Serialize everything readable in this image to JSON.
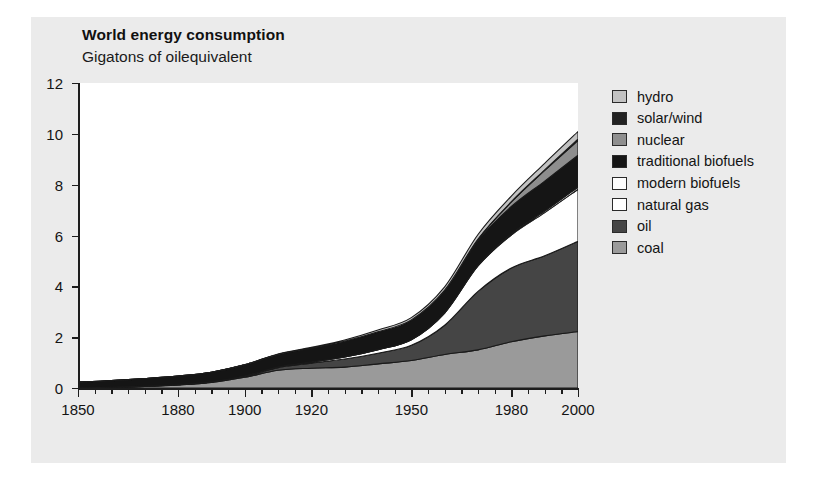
{
  "figure": {
    "background": "#ebebeb",
    "plot_background": "#ffffff",
    "page_background": "#ffffff"
  },
  "chart_data": {
    "type": "area",
    "stacked": true,
    "title": "World energy consumption",
    "subtitle": "Gigatons of oilequivalent",
    "xlabel": "",
    "ylabel": "Gigatons of oilequivalent",
    "xlim": [
      1850,
      2000
    ],
    "ylim": [
      0,
      12
    ],
    "grid": false,
    "legend_position": "right",
    "xticks": [
      1850,
      1860,
      1870,
      1880,
      1890,
      1900,
      1910,
      1920,
      1930,
      1940,
      1950,
      1960,
      1970,
      1980,
      1990,
      2000
    ],
    "xtick_labels": [
      "1850",
      "",
      "",
      "1880",
      "",
      "1900",
      "",
      "1920",
      "",
      "",
      "1950",
      "",
      "",
      "1980",
      "",
      "2000"
    ],
    "yticks": [
      0,
      2,
      4,
      6,
      8,
      10,
      12
    ],
    "ytick_labels": [
      "0",
      "2",
      "4",
      "6",
      "8",
      "10",
      "12"
    ],
    "x": [
      1850,
      1860,
      1870,
      1880,
      1890,
      1900,
      1910,
      1920,
      1930,
      1940,
      1950,
      1960,
      1970,
      1980,
      1990,
      2000
    ],
    "series": [
      {
        "name": "coal",
        "color": "#9a9a9a",
        "values": [
          0.01,
          0.03,
          0.06,
          0.12,
          0.22,
          0.42,
          0.7,
          0.78,
          0.82,
          0.95,
          1.08,
          1.32,
          1.5,
          1.82,
          2.05,
          2.22
        ]
      },
      {
        "name": "oil",
        "color": "#454545",
        "values": [
          0.0,
          0.0,
          0.01,
          0.01,
          0.02,
          0.04,
          0.1,
          0.2,
          0.32,
          0.42,
          0.6,
          1.15,
          2.3,
          2.9,
          3.15,
          3.55
        ]
      },
      {
        "name": "natural gas",
        "color": "#ffffff",
        "values": [
          0.0,
          0.0,
          0.0,
          0.0,
          0.0,
          0.01,
          0.02,
          0.04,
          0.08,
          0.14,
          0.22,
          0.48,
          1.0,
          1.3,
          1.7,
          2.05
        ]
      },
      {
        "name": "modern biofuels",
        "color": "#fdfdfd",
        "values": [
          0.0,
          0.0,
          0.0,
          0.0,
          0.0,
          0.0,
          0.0,
          0.0,
          0.0,
          0.0,
          0.0,
          0.01,
          0.02,
          0.04,
          0.06,
          0.09
        ]
      },
      {
        "name": "traditional biofuels",
        "color": "#151515",
        "values": [
          0.22,
          0.26,
          0.3,
          0.34,
          0.38,
          0.44,
          0.5,
          0.55,
          0.62,
          0.7,
          0.78,
          0.88,
          0.98,
          1.08,
          1.18,
          1.25
        ]
      },
      {
        "name": "nuclear",
        "color": "#8e8e8e",
        "values": [
          0.0,
          0.0,
          0.0,
          0.0,
          0.0,
          0.0,
          0.0,
          0.0,
          0.0,
          0.0,
          0.0,
          0.01,
          0.06,
          0.18,
          0.42,
          0.58
        ]
      },
      {
        "name": "solar/wind",
        "color": "#222222",
        "values": [
          0.0,
          0.0,
          0.0,
          0.0,
          0.0,
          0.0,
          0.0,
          0.0,
          0.0,
          0.0,
          0.0,
          0.0,
          0.0,
          0.01,
          0.02,
          0.05
        ]
      },
      {
        "name": "hydro",
        "color": "#c2c2c2",
        "values": [
          0.0,
          0.0,
          0.0,
          0.0,
          0.0,
          0.01,
          0.02,
          0.03,
          0.05,
          0.07,
          0.09,
          0.13,
          0.18,
          0.22,
          0.26,
          0.3
        ]
      }
    ],
    "totals_note": "stack totals reach about 10.1 Gt oil-equivalent in 2000"
  },
  "legend": {
    "items": [
      {
        "label": "hydro",
        "color": "#c2c2c2"
      },
      {
        "label": "solar/wind",
        "color": "#222222"
      },
      {
        "label": "nuclear",
        "color": "#8e8e8e"
      },
      {
        "label": "traditional biofuels",
        "color": "#151515"
      },
      {
        "label": "modern biofuels",
        "color": "#fdfdfd"
      },
      {
        "label": "natural gas",
        "color": "#ffffff"
      },
      {
        "label": "oil",
        "color": "#454545"
      },
      {
        "label": "coal",
        "color": "#9a9a9a"
      }
    ]
  }
}
